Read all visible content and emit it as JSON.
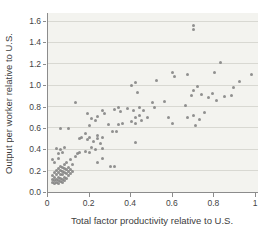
{
  "chart_data": {
    "type": "scatter",
    "title": "",
    "xlabel": "Total factor productivity relative to U.S.",
    "ylabel": "Output per worker relative to U.S.",
    "xlim": [
      0,
      1
    ],
    "ylim": [
      0,
      1.6
    ],
    "x_ticks": [
      0,
      0.2,
      0.4,
      0.6,
      0.8,
      1
    ],
    "x_tick_labels": [
      "0",
      "0.2",
      "0.4",
      "0.6",
      "0.8",
      "1"
    ],
    "y_ticks": [
      0,
      0.2,
      0.4,
      0.6,
      0.8,
      1.0,
      1.2,
      1.4,
      1.6
    ],
    "y_tick_labels": [
      "0.0",
      "0.2",
      "0.4",
      "0.6",
      "0.8",
      "1.0",
      "1.2",
      "1.4",
      "1.6"
    ],
    "grid": "horizontal",
    "legend": "none",
    "colors": {
      "point": "rgba(122,122,122,0.82)",
      "plot_background": "#f3f3ef",
      "gridline": "#d8d8d2",
      "axis": "#8c8c8c",
      "text": "#404040"
    },
    "points": [
      [
        0.02,
        0.09
      ],
      [
        0.02,
        0.12
      ],
      [
        0.02,
        0.15
      ],
      [
        0.03,
        0.08
      ],
      [
        0.03,
        0.11
      ],
      [
        0.03,
        0.14
      ],
      [
        0.03,
        0.18
      ],
      [
        0.04,
        0.09
      ],
      [
        0.04,
        0.12
      ],
      [
        0.04,
        0.16
      ],
      [
        0.04,
        0.2
      ],
      [
        0.05,
        0.08
      ],
      [
        0.05,
        0.11
      ],
      [
        0.05,
        0.14
      ],
      [
        0.05,
        0.18
      ],
      [
        0.05,
        0.22
      ],
      [
        0.06,
        0.1
      ],
      [
        0.06,
        0.13
      ],
      [
        0.06,
        0.16
      ],
      [
        0.06,
        0.2
      ],
      [
        0.06,
        0.24
      ],
      [
        0.07,
        0.09
      ],
      [
        0.07,
        0.12
      ],
      [
        0.07,
        0.16
      ],
      [
        0.07,
        0.19
      ],
      [
        0.07,
        0.23
      ],
      [
        0.08,
        0.11
      ],
      [
        0.08,
        0.14
      ],
      [
        0.08,
        0.18
      ],
      [
        0.08,
        0.22
      ],
      [
        0.08,
        0.26
      ],
      [
        0.09,
        0.13
      ],
      [
        0.09,
        0.17
      ],
      [
        0.09,
        0.21
      ],
      [
        0.1,
        0.15
      ],
      [
        0.1,
        0.19
      ],
      [
        0.1,
        0.23
      ],
      [
        0.11,
        0.17
      ],
      [
        0.11,
        0.21
      ],
      [
        0.12,
        0.19
      ],
      [
        0.02,
        0.3
      ],
      [
        0.03,
        0.28
      ],
      [
        0.04,
        0.41
      ],
      [
        0.05,
        0.36
      ],
      [
        0.05,
        0.31
      ],
      [
        0.06,
        0.4
      ],
      [
        0.07,
        0.37
      ],
      [
        0.08,
        0.42
      ],
      [
        0.09,
        0.28
      ],
      [
        0.11,
        0.3
      ],
      [
        0.12,
        0.26
      ],
      [
        0.13,
        0.33
      ],
      [
        0.14,
        0.36
      ],
      [
        0.15,
        0.37
      ],
      [
        0.18,
        0.38
      ],
      [
        0.2,
        0.37
      ],
      [
        0.15,
        0.5
      ],
      [
        0.16,
        0.51
      ],
      [
        0.18,
        0.55
      ],
      [
        0.19,
        0.49
      ],
      [
        0.2,
        0.51
      ],
      [
        0.21,
        0.42
      ],
      [
        0.22,
        0.47
      ],
      [
        0.23,
        0.4
      ],
      [
        0.24,
        0.5
      ],
      [
        0.24,
        0.28
      ],
      [
        0.25,
        0.45
      ],
      [
        0.26,
        0.41
      ],
      [
        0.26,
        0.31
      ],
      [
        0.3,
        0.24
      ],
      [
        0.32,
        0.24
      ],
      [
        0.06,
        0.59
      ],
      [
        0.1,
        0.59
      ],
      [
        0.13,
        0.84
      ],
      [
        0.19,
        0.73
      ],
      [
        0.2,
        0.62
      ],
      [
        0.21,
        0.69
      ],
      [
        0.23,
        0.67
      ],
      [
        0.24,
        0.53
      ],
      [
        0.24,
        0.71
      ],
      [
        0.26,
        0.51
      ],
      [
        0.26,
        0.76
      ],
      [
        0.27,
        0.73
      ],
      [
        0.29,
        0.63
      ],
      [
        0.31,
        0.57
      ],
      [
        0.33,
        0.57
      ],
      [
        0.32,
        0.77
      ],
      [
        0.34,
        0.79
      ],
      [
        0.34,
        0.63
      ],
      [
        0.35,
        0.75
      ],
      [
        0.36,
        0.64
      ],
      [
        0.38,
        0.78
      ],
      [
        0.4,
        0.66
      ],
      [
        0.41,
        0.76
      ],
      [
        0.42,
        0.7
      ],
      [
        0.42,
        0.64
      ],
      [
        0.44,
        0.79
      ],
      [
        0.44,
        0.72
      ],
      [
        0.46,
        0.76
      ],
      [
        0.45,
        0.67
      ],
      [
        0.48,
        0.7
      ],
      [
        0.42,
        0.46
      ],
      [
        0.5,
        0.84
      ],
      [
        0.56,
        0.85
      ],
      [
        0.4,
        1.0
      ],
      [
        0.42,
        1.02
      ],
      [
        0.43,
        0.93
      ],
      [
        0.52,
        1.04
      ],
      [
        0.51,
        0.79
      ],
      [
        0.58,
        0.7
      ],
      [
        0.6,
        0.64
      ],
      [
        0.66,
        0.81
      ],
      [
        0.67,
        0.7
      ],
      [
        0.7,
        0.72
      ],
      [
        0.71,
        0.62
      ],
      [
        0.73,
        0.68
      ],
      [
        0.75,
        0.74
      ],
      [
        0.6,
        1.12
      ],
      [
        0.61,
        1.08
      ],
      [
        0.67,
        1.1
      ],
      [
        0.7,
        1.56
      ],
      [
        0.7,
        1.52
      ],
      [
        0.69,
        0.9
      ],
      [
        0.7,
        0.95
      ],
      [
        0.72,
        0.99
      ],
      [
        0.74,
        0.91
      ],
      [
        0.77,
        0.88
      ],
      [
        0.79,
        0.92
      ],
      [
        0.8,
        1.12
      ],
      [
        0.81,
        0.86
      ],
      [
        0.83,
        1.21
      ],
      [
        0.85,
        0.89
      ],
      [
        0.88,
        0.9
      ],
      [
        0.89,
        0.98
      ],
      [
        0.92,
        1.03
      ],
      [
        0.98,
        1.1
      ]
    ]
  }
}
